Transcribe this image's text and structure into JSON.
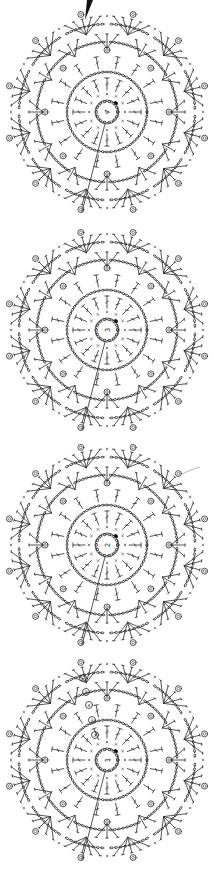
{
  "diagram": {
    "type": "crochet-chart",
    "background": "#ffffff",
    "ink_color": "#2a2a2a",
    "start_marker": {
      "shape": "filled-wedge",
      "x": 87,
      "y": 0
    },
    "motifs": [
      {
        "id": 1,
        "cx": 107,
        "cy": 112,
        "center_label": "4",
        "label_rotation": -60,
        "round_markers": []
      },
      {
        "id": 2,
        "cx": 107,
        "cy": 330,
        "center_label": "3",
        "label_rotation": -90,
        "round_markers": []
      },
      {
        "id": 3,
        "cx": 107,
        "cy": 545,
        "center_label": "2",
        "label_rotation": -90,
        "round_markers": []
      },
      {
        "id": 4,
        "cx": 107,
        "cy": 760,
        "center_label": "1",
        "label_rotation": -90,
        "round_markers": [
          "2",
          "3",
          "4",
          "5",
          "6"
        ]
      }
    ],
    "join_points": [
      {
        "between": [
          1,
          2
        ],
        "x": 84,
        "y": 213
      },
      {
        "between": [
          2,
          3
        ],
        "x": 84,
        "y": 430
      },
      {
        "between": [
          3,
          4
        ],
        "x": 84,
        "y": 645
      }
    ],
    "tail": {
      "motif": 3,
      "x": 192,
      "y": 470
    },
    "symbols": {
      "chain": "oval",
      "single_crochet": "x",
      "double_crochet": "T-with-bar",
      "picot": "small-loop",
      "cluster": "fan",
      "round_marker": "circled-number"
    }
  }
}
